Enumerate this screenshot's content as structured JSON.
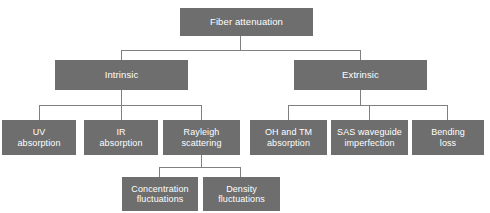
{
  "diagram": {
    "title": "Fiber attenuation",
    "type": "hierarchy-tree",
    "colors": {
      "node_fill": "#6e6e6e",
      "node_text": "#ffffff",
      "connector": "#808080",
      "background": "#ffffff"
    },
    "nodes": {
      "root": {
        "label": "Fiber attenuation",
        "level": 1
      },
      "intrinsic": {
        "label": "Intrinsic",
        "level": 2
      },
      "extrinsic": {
        "label": "Extrinsic",
        "level": 2
      },
      "uv_absorption": {
        "label": "UV\nabsorption",
        "level": 3
      },
      "ir_absorption": {
        "label": "IR\nabsorption",
        "level": 3
      },
      "rayleigh_scattering": {
        "label": "Rayleigh\nscattering",
        "level": 3
      },
      "oh_tm_absorption": {
        "label": "OH and TM\nabsorption",
        "level": 3
      },
      "sas_waveguide_imperfection": {
        "label": "SAS waveguide\nimperfection",
        "level": 3
      },
      "bending_loss": {
        "label": "Bending\nloss",
        "level": 3
      },
      "concentration_fluctuations": {
        "label": "Concentration\nfluctuations",
        "level": 4
      },
      "density_fluctuations": {
        "label": "Density\nfluctuations",
        "level": 4
      }
    }
  }
}
